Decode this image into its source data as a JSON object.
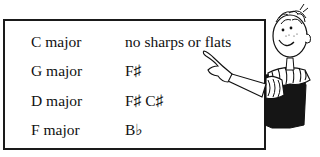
{
  "table": {
    "rows": [
      {
        "key": "C major",
        "signature": "no sharps or flats"
      },
      {
        "key": "G major",
        "signature": "F♯"
      },
      {
        "key": "D major",
        "signature": "F♯ C♯"
      },
      {
        "key": "F major",
        "signature": "B♭"
      }
    ]
  },
  "illustration": {
    "description": "cartoon boy pointing at the table"
  }
}
